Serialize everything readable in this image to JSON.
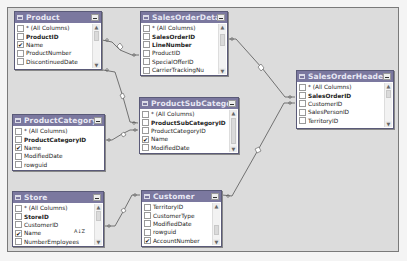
{
  "diagram": {
    "tables": {
      "product": {
        "title": "Product",
        "rows": [
          {
            "label": "* (All Columns)",
            "checked": false,
            "bold": false
          },
          {
            "label": "ProductID",
            "checked": false,
            "bold": true
          },
          {
            "label": "Name",
            "checked": true,
            "bold": false
          },
          {
            "label": "ProductNumber",
            "checked": false,
            "bold": false
          },
          {
            "label": "DiscontinuedDate",
            "checked": false,
            "bold": false
          }
        ]
      },
      "sales_order_detail": {
        "title": "SalesOrderDetail",
        "rows": [
          {
            "label": "* (All Columns)",
            "checked": false,
            "bold": false
          },
          {
            "label": "SalesOrderID",
            "checked": false,
            "bold": true
          },
          {
            "label": "LineNumber",
            "checked": false,
            "bold": true
          },
          {
            "label": "ProductID",
            "checked": false,
            "bold": false
          },
          {
            "label": "SpecialOfferID",
            "checked": false,
            "bold": false
          },
          {
            "label": "CarrierTrackingNu",
            "checked": false,
            "bold": false
          }
        ]
      },
      "sales_order_header": {
        "title": "SalesOrderHeader",
        "rows": [
          {
            "label": "* (All Columns)",
            "checked": false,
            "bold": false
          },
          {
            "label": "SalesOrderID",
            "checked": false,
            "bold": true
          },
          {
            "label": "CustomerID",
            "checked": false,
            "bold": false
          },
          {
            "label": "SalesPersonID",
            "checked": false,
            "bold": false
          },
          {
            "label": "TerritoryID",
            "checked": false,
            "bold": false
          }
        ]
      },
      "product_category": {
        "title": "ProductCategory",
        "rows": [
          {
            "label": "* (All Columns)",
            "checked": false,
            "bold": false
          },
          {
            "label": "ProductCategoryID",
            "checked": false,
            "bold": true
          },
          {
            "label": "Name",
            "checked": true,
            "bold": false
          },
          {
            "label": "ModifiedDate",
            "checked": false,
            "bold": false
          },
          {
            "label": "rowguid",
            "checked": false,
            "bold": false
          }
        ]
      },
      "product_sub_category": {
        "title": "ProductSubCategory",
        "rows": [
          {
            "label": "* (All Columns)",
            "checked": false,
            "bold": false
          },
          {
            "label": "ProductSubCategoryID",
            "checked": false,
            "bold": true
          },
          {
            "label": "ProductCategoryID",
            "checked": false,
            "bold": false
          },
          {
            "label": "Name",
            "checked": true,
            "bold": false
          },
          {
            "label": "ModifiedDate",
            "checked": false,
            "bold": false
          }
        ]
      },
      "store": {
        "title": "Store",
        "rows": [
          {
            "label": "* (All Columns)",
            "checked": false,
            "bold": false
          },
          {
            "label": "StoreID",
            "checked": false,
            "bold": true
          },
          {
            "label": "CustomerID",
            "checked": false,
            "bold": false
          },
          {
            "label": "Name",
            "checked": true,
            "bold": false
          },
          {
            "label": "NumberEmployees",
            "checked": false,
            "bold": false
          }
        ],
        "sort_indicator": "A↓Z"
      },
      "customer": {
        "title": "Customer",
        "rows": [
          {
            "label": "TerritoryID",
            "checked": false,
            "bold": false
          },
          {
            "label": "CustomerType",
            "checked": false,
            "bold": false
          },
          {
            "label": "ModifiedDate",
            "checked": false,
            "bold": false
          },
          {
            "label": "rowguid",
            "checked": false,
            "bold": false
          },
          {
            "label": "AccountNumber",
            "checked": true,
            "bold": false
          }
        ]
      }
    },
    "check_glyph": "✔",
    "scroll_up_glyph": "▲",
    "scroll_down_glyph": "▼",
    "relationships": [
      {
        "from": "Product",
        "to": "SalesOrderDetail"
      },
      {
        "from": "Product",
        "to": "ProductSubCategory"
      },
      {
        "from": "ProductCategory",
        "to": "ProductSubCategory"
      },
      {
        "from": "SalesOrderDetail",
        "to": "SalesOrderHeader"
      },
      {
        "from": "Customer",
        "to": "SalesOrderHeader"
      },
      {
        "from": "Store",
        "to": "Customer"
      }
    ],
    "colors": {
      "header_bg": "#7b789f",
      "canvas_bg": "#dcdcdc",
      "link": "#555555"
    }
  }
}
